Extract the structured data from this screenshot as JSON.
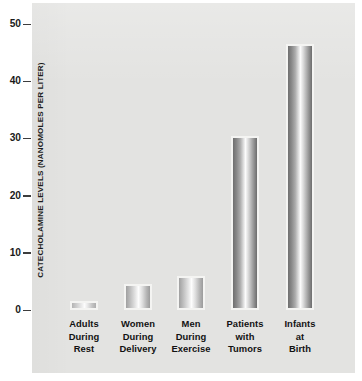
{
  "chart_data": {
    "type": "bar",
    "title": "",
    "xlabel": "",
    "ylabel": "CATECHOLAMINE LEVELS (NANOMOLES PER LITER)",
    "ylim": [
      0,
      50
    ],
    "yticks": [
      0,
      10,
      20,
      30,
      40,
      50
    ],
    "ytick_labels": [
      "0",
      "10",
      "20",
      "30",
      "40",
      "50"
    ],
    "grid": false,
    "legend": null,
    "categories": [
      "Adults During Rest",
      "Women During Delivery",
      "Men During Exercise",
      "Patients with Tumors",
      "Infants at Birth"
    ],
    "category_lines": [
      [
        "Adults",
        "During",
        "Rest"
      ],
      [
        "Women",
        "During",
        "Delivery"
      ],
      [
        "Men",
        "During",
        "Exercise"
      ],
      [
        "Patients",
        "with",
        "Tumors"
      ],
      [
        "Infants",
        "at",
        "Birth"
      ]
    ],
    "values": [
      1.5,
      4.5,
      6,
      30.5,
      46.5
    ],
    "bar_style": "horizontal-gradient-gray",
    "colors": {
      "panel_background": "#e3e3e1",
      "figure_background": "#ffffff",
      "bar_edge": "#6f6f6f",
      "bar_center": "#fbfbfb",
      "bar_outline": "#f4f4f2",
      "tick_mark": "#3d3d3d",
      "text": "#121212"
    }
  }
}
